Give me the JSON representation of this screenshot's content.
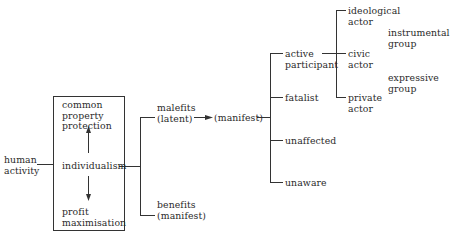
{
  "diagram": {
    "root": "human\nactivity",
    "box": {
      "top": "common\nproperty\nprotection",
      "center": "individualism",
      "bottom": "profit\nmaximisation"
    },
    "outcomes": {
      "malefits": "malefits\n(latent)",
      "benefits": "benefits\n(manifest)",
      "manifest": "(manifest)"
    },
    "responses": {
      "active": "active\nparticipant",
      "fatalist": "fatalist",
      "unaffected": "unaffected",
      "unaware": "unaware"
    },
    "actors": {
      "ideological": "ideological\nactor",
      "civic": "civic\nactor",
      "private": "private\nactor"
    },
    "groups": {
      "instrumental": "instrumental\ngroup",
      "expressive": "expressive\ngroup"
    }
  }
}
